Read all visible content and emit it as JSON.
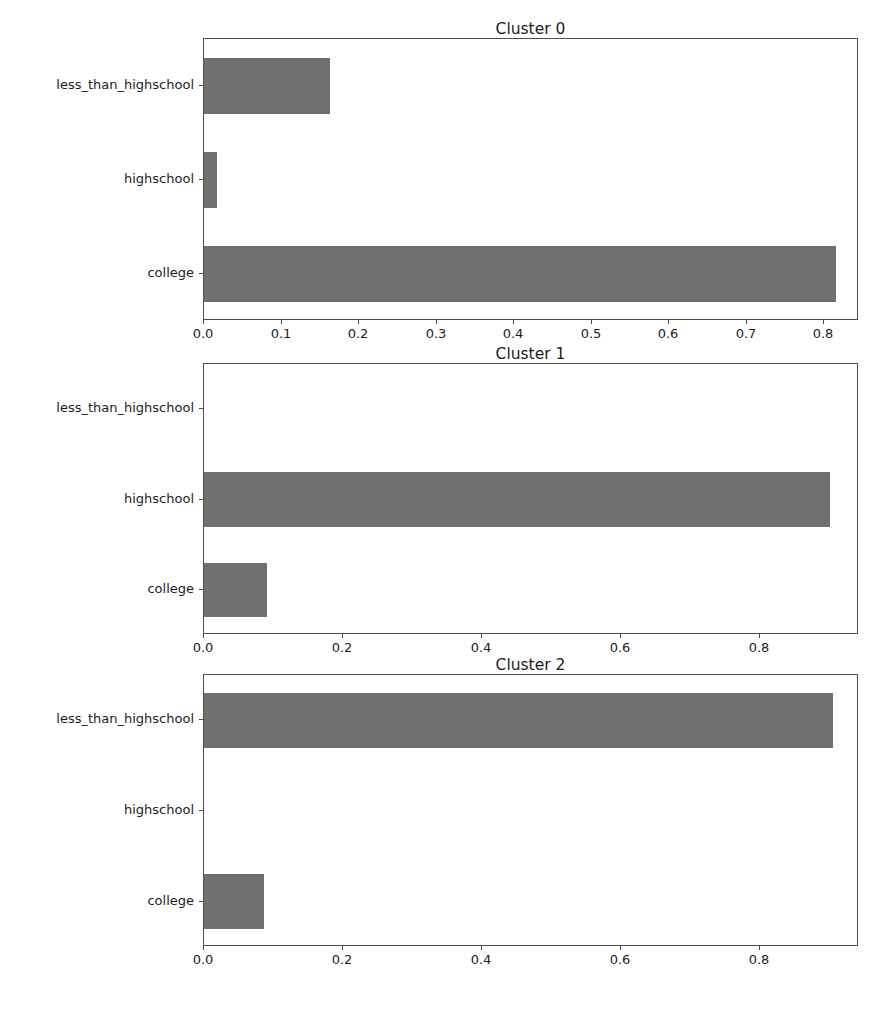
{
  "figure": {
    "width": 886,
    "height": 1022,
    "background": "#ffffff",
    "bar_color": "#70706f",
    "axis_color": "#4d4d4d",
    "text_color": "#1c1c1c"
  },
  "chart_data": [
    {
      "type": "bar",
      "orientation": "horizontal",
      "title": "Cluster 0",
      "xlabel": "",
      "ylabel": "",
      "categories": [
        "less_than_highschool",
        "highschool",
        "college"
      ],
      "values": [
        0.163,
        0.017,
        0.815
      ],
      "xlim": [
        0.0,
        0.845
      ],
      "xticks": [
        0.0,
        0.1,
        0.2,
        0.3,
        0.4,
        0.5,
        0.6,
        0.7,
        0.8
      ],
      "xticklabels": [
        "0.0",
        "0.1",
        "0.2",
        "0.3",
        "0.4",
        "0.5",
        "0.6",
        "0.7",
        "0.8"
      ],
      "grid": false,
      "legend": false
    },
    {
      "type": "bar",
      "orientation": "horizontal",
      "title": "Cluster 1",
      "xlabel": "",
      "ylabel": "",
      "categories": [
        "less_than_highschool",
        "highschool",
        "college"
      ],
      "values": [
        0.0,
        0.901,
        0.091
      ],
      "xlim": [
        0.0,
        0.942
      ],
      "xticks": [
        0.0,
        0.2,
        0.4,
        0.6,
        0.8
      ],
      "xticklabels": [
        "0.0",
        "0.2",
        "0.4",
        "0.6",
        "0.8"
      ],
      "grid": false,
      "legend": false
    },
    {
      "type": "bar",
      "orientation": "horizontal",
      "title": "Cluster 2",
      "xlabel": "",
      "ylabel": "",
      "categories": [
        "less_than_highschool",
        "highschool",
        "college"
      ],
      "values": [
        0.904,
        0.0,
        0.086
      ],
      "xlim": [
        0.0,
        0.942
      ],
      "xticks": [
        0.0,
        0.2,
        0.4,
        0.6,
        0.8
      ],
      "xticklabels": [
        "0.0",
        "0.2",
        "0.4",
        "0.6",
        "0.8"
      ],
      "grid": false,
      "legend": false
    }
  ]
}
